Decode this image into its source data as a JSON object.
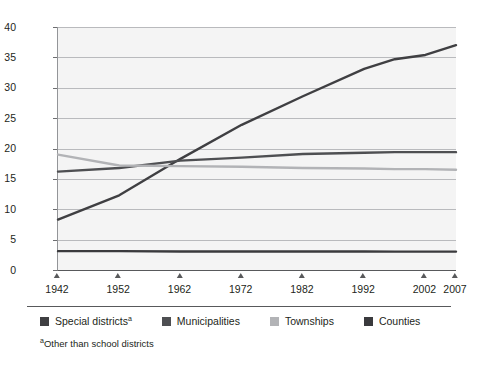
{
  "chart_data": {
    "type": "line",
    "title": "",
    "xlabel": "",
    "ylabel": "Thousands",
    "xlim": [
      1942,
      2007
    ],
    "ylim": [
      0,
      40
    ],
    "grid": true,
    "legend_position": "bottom",
    "x_tick_labels": [
      "1942",
      "1952",
      "1962",
      "1972",
      "1982",
      "1992",
      "2002",
      "2007"
    ],
    "x_ticks": [
      1942,
      1952,
      1962,
      1972,
      1982,
      1992,
      2002,
      2007
    ],
    "y_tick_labels": [
      "0",
      "5",
      "10",
      "15",
      "20",
      "25",
      "30",
      "35",
      "40"
    ],
    "y_ticks": [
      0,
      5,
      10,
      15,
      20,
      25,
      30,
      35,
      40
    ],
    "x": [
      1942,
      1952,
      1962,
      1972,
      1982,
      1992,
      1997,
      2002,
      2007
    ],
    "series": [
      {
        "name": "Special districts",
        "name_marked": "Special districtsᵃ",
        "color": "#3f3f42",
        "values": [
          8.3,
          12.3,
          18.3,
          23.9,
          28.6,
          33.1,
          34.7,
          35.4,
          37.0
        ]
      },
      {
        "name": "Municipalities",
        "name_marked": "Municipalities",
        "color": "#4e4f52",
        "values": [
          16.2,
          16.8,
          18.0,
          18.5,
          19.1,
          19.3,
          19.4,
          19.4,
          19.4
        ]
      },
      {
        "name": "Townships",
        "name_marked": "Townships",
        "color": "#b2b3b6",
        "values": [
          19.0,
          17.2,
          17.1,
          17.0,
          16.8,
          16.7,
          16.6,
          16.6,
          16.5
        ]
      },
      {
        "name": "Counties",
        "name_marked": "Counties",
        "color": "#3a3a3d",
        "values": [
          3.1,
          3.1,
          3.05,
          3.05,
          3.04,
          3.04,
          3.03,
          3.03,
          3.03
        ]
      }
    ],
    "footnote": "ᵃOther than school districts",
    "footnote_marker": "a",
    "footnote_text": "Other than school districts"
  },
  "legend": {
    "items": [
      {
        "label": "Special districts",
        "marker": "a",
        "color": "#3f3f42"
      },
      {
        "label": "Municipalities",
        "marker": "",
        "color": "#4e4f52"
      },
      {
        "label": "Townships",
        "marker": "",
        "color": "#b2b3b6"
      },
      {
        "label": "Counties",
        "marker": "",
        "color": "#3a3a3d"
      }
    ]
  },
  "axes": {
    "y_title": "Thousands"
  }
}
